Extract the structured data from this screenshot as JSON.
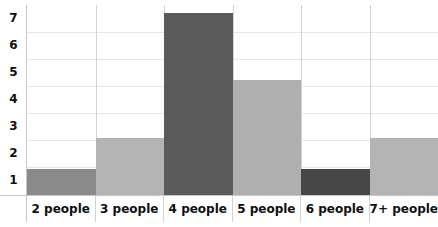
{
  "chart_data": {
    "type": "bar",
    "title": "",
    "xlabel": "",
    "ylabel": "",
    "categories": [
      "2 people",
      "3 people",
      "4 people",
      "5 people",
      "6 people",
      "7+ people"
    ],
    "values": [
      1,
      2.2,
      7,
      4.4,
      1,
      2.2
    ],
    "ylim": [
      0,
      7.3
    ],
    "yticks": [
      7,
      6,
      5,
      4,
      3,
      2,
      1
    ],
    "ytick_labels": [
      "7",
      "6",
      "5",
      "4",
      "3",
      "2",
      "1"
    ],
    "grid": true,
    "legend": false,
    "bar_colors": [
      "#8a8a8a",
      "#b4b4b4",
      "#5a5a5a",
      "#b0b0b0",
      "#474747",
      "#b4b4b4"
    ],
    "series": [
      {
        "name": "count",
        "values": [
          1,
          2.2,
          7,
          4.4,
          1,
          2.2
        ]
      }
    ]
  },
  "axis": {
    "y": {
      "t7": "7",
      "t6": "6",
      "t5": "5",
      "t4": "4",
      "t3": "3",
      "t2": "2",
      "t1": "1"
    },
    "x": {
      "c0": "2 people",
      "c1": "3 people",
      "c2": "4 people",
      "c3": "5 people",
      "c4": "6 people",
      "c5": "7+ people"
    }
  },
  "colors": {
    "background": "#ffffff",
    "gridline": "#e6e6e6",
    "border": "#c8c8c8",
    "separator": "#d2d2d2",
    "text": "#0f0f0f"
  },
  "title_sliver": ""
}
